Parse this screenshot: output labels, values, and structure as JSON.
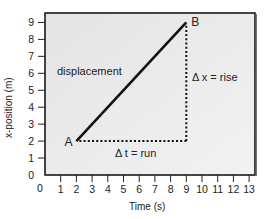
{
  "chart_data": {
    "type": "line",
    "title": "",
    "xlabel": "Time (s)",
    "ylabel": "x-position (m)",
    "xlim": [
      0,
      13
    ],
    "ylim": [
      0,
      9.5
    ],
    "x_ticks": [
      0,
      1,
      2,
      3,
      4,
      5,
      6,
      7,
      8,
      9,
      10,
      11,
      12,
      13
    ],
    "y_ticks": [
      0,
      1,
      2,
      3,
      4,
      5,
      6,
      7,
      8,
      9
    ],
    "grid": false,
    "series": [
      {
        "name": "displacement",
        "x": [
          2,
          9
        ],
        "y": [
          2,
          9
        ],
        "style": "solid"
      }
    ],
    "points": [
      {
        "label": "A",
        "x": 2,
        "y": 2
      },
      {
        "label": "B",
        "x": 9,
        "y": 9
      }
    ],
    "annotations": [
      {
        "text": "displacement",
        "x": 3.2,
        "y": 6.1
      },
      {
        "text": "Δ t = run",
        "x": 5.5,
        "y": 1.5,
        "segment": {
          "from": [
            2,
            2
          ],
          "to": [
            9,
            2
          ],
          "style": "dotted"
        }
      },
      {
        "text": "Δ x = rise",
        "x": 9.1,
        "y": 5.2,
        "segment": {
          "from": [
            9,
            2
          ],
          "to": [
            9,
            9
          ],
          "style": "dotted"
        }
      }
    ],
    "colors": {
      "plot_bg": "#ececec",
      "line": "#111111",
      "frame": "#222222"
    }
  },
  "labels": {
    "xlabel": "Time (s)",
    "ylabel": "x-position (m)",
    "point_a": "A",
    "point_b": "B",
    "displacement": "displacement",
    "run": "Δ t = run",
    "rise": "Δ x = rise"
  }
}
